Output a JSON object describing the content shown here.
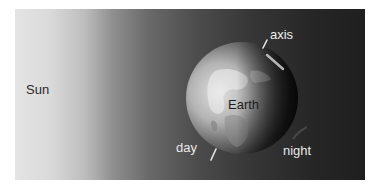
{
  "figure": {
    "labels": {
      "sun": "Sun",
      "earth": "Earth",
      "axis": "axis",
      "day": "day",
      "night": "night"
    },
    "colors": {
      "sun_side": "#e4e4e4",
      "space_dark": "#1f1f1f",
      "earth_day": "#dcdcdc",
      "earth_night": "#262626",
      "axis_line": "#e6e6e6"
    }
  }
}
